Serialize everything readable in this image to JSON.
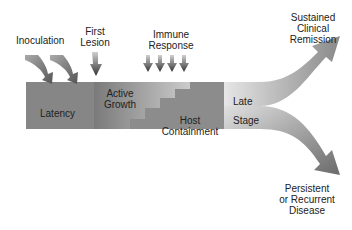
{
  "diagram": {
    "top_labels": {
      "inoculation": "Inoculation",
      "first_lesion_1": "First",
      "first_lesion_2": "Lesion",
      "immune_1": "Immune",
      "immune_2": "Response"
    },
    "phases": {
      "latency": "Latency",
      "active_1": "Active",
      "active_2": "Growth",
      "host_1": "Host",
      "host_2": "Containment",
      "late": "Late",
      "stage": "Stage"
    },
    "outcomes": {
      "remission_1": "Sustained",
      "remission_2": "Clinical",
      "remission_3": "Remission",
      "persistent_1": "Persistent",
      "persistent_2": "or Recurrent",
      "persistent_3": "Disease"
    }
  }
}
